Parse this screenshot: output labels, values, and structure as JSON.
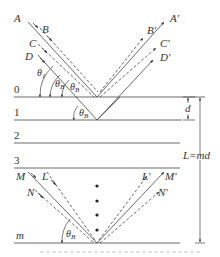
{
  "figure": {
    "layers": [
      {
        "label": "0"
      },
      {
        "label": "1"
      },
      {
        "label": "2"
      },
      {
        "label": "3"
      },
      {
        "label": "m"
      }
    ],
    "incident_rays_top": [
      "A",
      "B",
      "C",
      "D"
    ],
    "reflected_rays_top": [
      "A'",
      "B'",
      "C'",
      "D'"
    ],
    "incident_rays_bottom": [
      "M",
      "L",
      "N"
    ],
    "reflected_rays_bottom": [
      "L'",
      "M'",
      "N'"
    ],
    "angles": {
      "theta_1": "θ",
      "theta_1_sub": "1",
      "theta_B": "θ",
      "theta_B_sub": "B"
    },
    "dimensions": {
      "spacing_label": "d",
      "total_label": "L=md"
    },
    "caption": ""
  }
}
